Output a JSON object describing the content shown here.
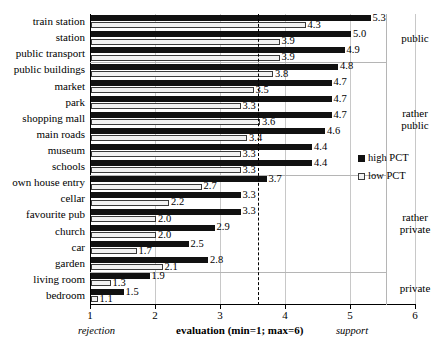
{
  "chart_data": {
    "type": "bar",
    "orientation": "horizontal",
    "title": "",
    "xlabel": "evaluation (min=1; max=6)",
    "ylabel": "",
    "xlim": [
      1,
      6
    ],
    "xticks": [
      1,
      2,
      3,
      4,
      5,
      6
    ],
    "xtick_labels": [
      "1",
      "2",
      "3",
      "4",
      "5",
      "6"
    ],
    "grid": true,
    "legend_position": "right",
    "reference_line": 3.58,
    "axis_captions": {
      "left": "rejection",
      "center": "evaluation (min=1; max=6)",
      "right": "support"
    },
    "categories": [
      "train station",
      "station",
      "public transport",
      "public buildings",
      "market",
      "park",
      "shopping mall",
      "main roads",
      "museum",
      "schools",
      "own house entry",
      "cellar",
      "favourite pub",
      "church",
      "car",
      "garden",
      "living room",
      "bedroom"
    ],
    "series": [
      {
        "name": "high PCT",
        "color": "#111111",
        "values": [
          5.3,
          5.0,
          4.9,
          4.8,
          4.7,
          4.7,
          4.7,
          4.6,
          4.4,
          4.4,
          3.7,
          3.3,
          3.3,
          2.9,
          2.5,
          2.8,
          1.9,
          1.5
        ]
      },
      {
        "name": "low PCT",
        "color": "#f2f2f2",
        "values": [
          4.3,
          3.9,
          3.9,
          3.8,
          3.5,
          3.3,
          3.6,
          3.4,
          3.3,
          3.3,
          2.7,
          2.2,
          2.0,
          2.0,
          1.7,
          2.1,
          1.3,
          1.1
        ]
      }
    ],
    "groups": [
      {
        "label": "public",
        "from": 0,
        "to": 2
      },
      {
        "label": "rather\npublic",
        "label_lines": [
          "rather",
          "public"
        ],
        "from": 3,
        "to": 9
      },
      {
        "label": "rather\nprivate",
        "label_lines": [
          "rather",
          "private"
        ],
        "from": 10,
        "to": 15
      },
      {
        "label": "private",
        "label_lines": [
          "private"
        ],
        "from": 16,
        "to": 17
      }
    ]
  },
  "legend": {
    "items": [
      {
        "label": "high PCT",
        "swatch": "high"
      },
      {
        "label": "low PCT",
        "swatch": "low"
      }
    ]
  }
}
